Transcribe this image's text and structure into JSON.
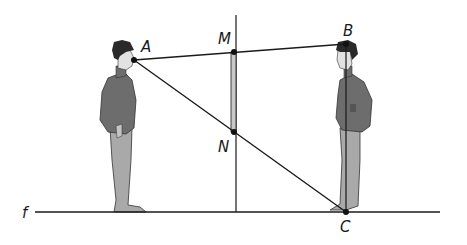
{
  "diagram": {
    "labels": {
      "A": "A",
      "B": "B",
      "M": "M",
      "N": "N",
      "C": "C",
      "f": "f"
    },
    "points": {
      "A": [
        134,
        60
      ],
      "B": [
        346,
        44
      ],
      "M": [
        234,
        52
      ],
      "N": [
        234,
        132
      ],
      "C": [
        346,
        212
      ]
    },
    "ground_line": {
      "x1": 35,
      "x2": 440,
      "y": 212
    },
    "mirror_axis": {
      "x": 236,
      "y1": 15,
      "y2": 212
    },
    "colors": {
      "line": "#1a1a1a",
      "mirror_fill": "#c8c8c8",
      "clothing_dark": "#6d6d6d",
      "clothing_light": "#a9a9a9",
      "skin": "#e2e2e2",
      "hair": "#2a2a2a"
    }
  }
}
